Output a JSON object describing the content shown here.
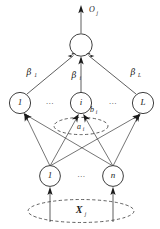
{
  "figure": {
    "type": "neural-network-diagram",
    "name": "Extreme Learning Machine (ELM) network topology",
    "background_color": "#ffffff",
    "stroke_color": "#2a2a2a",
    "text_color": "#1a1a1a",
    "dash_color": "#3a3a3a"
  },
  "output": {
    "signal_label": "O",
    "signal_subscript": "j",
    "node_label": ""
  },
  "weights": {
    "first": {
      "symbol": "β",
      "subscript": "1"
    },
    "middle": {
      "symbol": "β",
      "subscript": "i"
    },
    "last": {
      "symbol": "β",
      "subscript": "L"
    }
  },
  "hidden_layer": {
    "nodes": [
      {
        "label": "1"
      },
      {
        "label": "i"
      },
      {
        "label": "L"
      }
    ],
    "ellipsis_left": "…",
    "ellipsis_right": "…",
    "bias": {
      "symbol": "b",
      "subscript": "i"
    },
    "input_weight": {
      "symbol": "a",
      "subscript": "i"
    }
  },
  "input_layer": {
    "nodes": [
      {
        "label": "1"
      },
      {
        "label": "n"
      }
    ],
    "ellipsis": "…",
    "vector": {
      "symbol": "X",
      "subscript": "j"
    }
  }
}
